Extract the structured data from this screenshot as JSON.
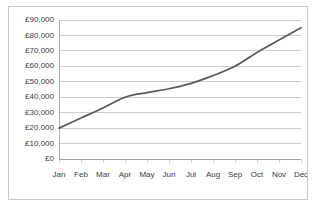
{
  "chart_data": {
    "type": "line",
    "title": "",
    "xlabel": "",
    "ylabel": "",
    "categories": [
      "Jan",
      "Feb",
      "Mar",
      "Apr",
      "May",
      "Jun",
      "Jul",
      "Aug",
      "Sep",
      "Oct",
      "Nov",
      "Dec"
    ],
    "series": [
      {
        "name": "",
        "values": [
          20000,
          26500,
          33000,
          40000,
          43000,
          45500,
          49000,
          54000,
          60000,
          69000,
          77000,
          85000
        ],
        "color": "#595959"
      }
    ],
    "ylim": [
      0,
      90000
    ],
    "ytick_values": [
      0,
      10000,
      20000,
      30000,
      40000,
      50000,
      60000,
      70000,
      80000,
      90000
    ],
    "ytick_labels": [
      "£0",
      "£10,000",
      "£20,000",
      "£30,000",
      "£40,000",
      "£50,000",
      "£60,000",
      "£70,000",
      "£80,000",
      "£90,000"
    ],
    "grid": true,
    "grid_axis": "y",
    "legend": false,
    "legend_position": "none",
    "currency_symbol": "£"
  },
  "chart_colors": {
    "line": "#595959",
    "gridline": "#b7b7b7",
    "axis": "#9a9a9a",
    "border": "#c9c9c9",
    "text": "#3a3a3a",
    "background": "#ffffff"
  }
}
